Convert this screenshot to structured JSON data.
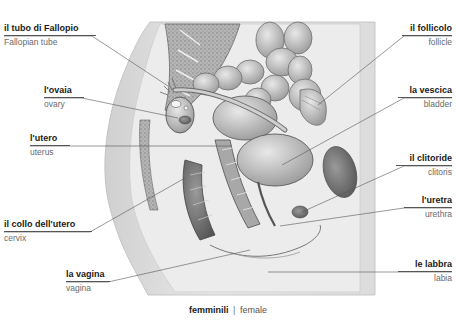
{
  "figure": {
    "colors": {
      "background": "#ffffff",
      "illustration_light": "#e6e6e6",
      "illustration_mid": "#b8b8b8",
      "illustration_dark": "#6e6e6e",
      "label_it": "#1a1a1a",
      "label_en": "#6a6a6a",
      "leader_line": "#555555"
    }
  },
  "labels_left": [
    {
      "it": "il tubo di Fallopio",
      "en": "Fallopian tube"
    },
    {
      "it": "l'ovaia",
      "en": "ovary"
    },
    {
      "it": "l'utero",
      "en": "uterus"
    },
    {
      "it": "il collo dell'utero",
      "en": "cervix"
    },
    {
      "it": "la vagina",
      "en": "vagina"
    }
  ],
  "labels_right": [
    {
      "it": "il follicolo",
      "en": "follicle"
    },
    {
      "it": "la vescica",
      "en": "bladder"
    },
    {
      "it": "il clitoride",
      "en": "clitoris"
    },
    {
      "it": "l'uretra",
      "en": "urethra"
    },
    {
      "it": "le labbra",
      "en": "labia"
    }
  ],
  "caption": {
    "it": "femminili",
    "separator": "|",
    "en": "female"
  }
}
